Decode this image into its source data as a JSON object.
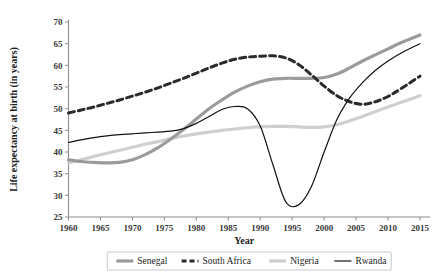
{
  "chart_data": {
    "type": "line",
    "title": "",
    "xlabel": "Year",
    "ylabel": "Life expectancy at birth (in years)",
    "xlim": [
      1960,
      2015
    ],
    "ylim": [
      25,
      70
    ],
    "xticks": [
      1960,
      1965,
      1970,
      1975,
      1980,
      1985,
      1990,
      1995,
      2000,
      2005,
      2010,
      2015
    ],
    "yticks": [
      25,
      30,
      35,
      40,
      45,
      50,
      55,
      60,
      65,
      70
    ],
    "xtick_labels": [
      "1960",
      "1965",
      "1970",
      "1975",
      "1980",
      "1985",
      "1990",
      "1995",
      "2000",
      "2005",
      "2010",
      "2015"
    ],
    "ytick_labels": [
      "25",
      "30",
      "35",
      "40",
      "45",
      "50",
      "55",
      "60",
      "65",
      "70"
    ],
    "grid": false,
    "legend_position": "bottom",
    "x": [
      1960,
      1962,
      1964,
      1966,
      1968,
      1970,
      1972,
      1974,
      1976,
      1978,
      1980,
      1982,
      1984,
      1986,
      1988,
      1990,
      1992,
      1994,
      1996,
      1998,
      2000,
      2002,
      2004,
      2006,
      2008,
      2010,
      2012,
      2015
    ],
    "series": [
      {
        "name": "Senegal",
        "color": "#9b9b9b",
        "style": "solid",
        "width": 3.2,
        "values": [
          38.2,
          37.8,
          37.6,
          37.5,
          37.6,
          38.2,
          39.4,
          41.0,
          43.0,
          45.2,
          47.6,
          50.0,
          52.0,
          53.8,
          55.2,
          56.2,
          56.8,
          57.0,
          57.0,
          57.0,
          57.2,
          58.0,
          59.4,
          61.0,
          62.4,
          63.8,
          65.2,
          67.0
        ]
      },
      {
        "name": "South Africa",
        "color": "#2b2b2b",
        "style": "dashed",
        "width": 3.0,
        "values": [
          49.0,
          49.7,
          50.4,
          51.2,
          52.0,
          52.9,
          53.8,
          54.8,
          55.9,
          57.0,
          58.2,
          59.4,
          60.5,
          61.4,
          61.9,
          62.1,
          62.2,
          61.7,
          60.2,
          57.8,
          55.2,
          53.0,
          51.6,
          51.0,
          51.6,
          52.8,
          54.6,
          57.5
        ]
      },
      {
        "name": "Nigeria",
        "color": "#cfcfcf",
        "style": "solid",
        "width": 3.2,
        "values": [
          37.5,
          38.2,
          39.0,
          39.7,
          40.4,
          41.1,
          41.8,
          42.4,
          43.1,
          43.7,
          44.2,
          44.6,
          45.0,
          45.3,
          45.6,
          45.8,
          45.9,
          45.9,
          45.8,
          45.7,
          45.8,
          46.3,
          47.2,
          48.2,
          49.3,
          50.4,
          51.4,
          53.0
        ]
      },
      {
        "name": "Rwanda",
        "color": "#111111",
        "style": "solid",
        "width": 1.2,
        "values": [
          42.2,
          42.8,
          43.3,
          43.7,
          44.0,
          44.2,
          44.4,
          44.6,
          44.8,
          45.4,
          46.6,
          48.2,
          49.8,
          50.5,
          50.0,
          46.0,
          37.0,
          28.5,
          27.8,
          32.0,
          40.0,
          47.5,
          52.5,
          56.0,
          58.8,
          61.0,
          62.8,
          65.0
        ]
      }
    ]
  },
  "legend": {
    "items": [
      {
        "label": "Senegal",
        "swatch": "senegal-swatch"
      },
      {
        "label": "South Africa",
        "swatch": "south-africa-swatch"
      },
      {
        "label": "Nigeria",
        "swatch": "nigeria-swatch"
      },
      {
        "label": "Rwanda",
        "swatch": "rwanda-swatch"
      }
    ]
  }
}
